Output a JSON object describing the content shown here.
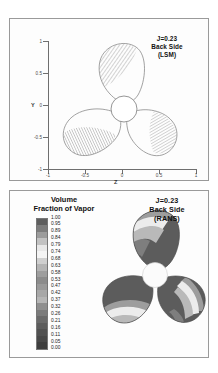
{
  "figure": {
    "panels": [
      {
        "id": "lsm",
        "annotation": [
          "J=0.23",
          "Back Side",
          "(LSM)"
        ],
        "xlabel": "Z",
        "ylabel": "Y",
        "xticks": [
          "-1",
          "-0.5",
          "0",
          "0.5",
          "1"
        ],
        "yticks": [
          "1",
          "0.5",
          "0",
          "-0.5",
          "-1"
        ]
      },
      {
        "id": "rans",
        "annotation": [
          "J=0.23",
          "Back Side",
          "(RANS)"
        ],
        "legend_title": [
          "Volume",
          "Fraction of Vapor"
        ]
      }
    ]
  },
  "chart_data": {
    "type": "heatmap",
    "subcharts": [
      {
        "name": "LSM",
        "annotation": "J=0.23 Back Side (LSM)",
        "xlabel": "Z",
        "ylabel": "Y",
        "xlim": [
          -1.25,
          1.25
        ],
        "ylim": [
          -1.15,
          1.15
        ],
        "xticks": [
          -1,
          -0.5,
          0,
          0.5,
          1
        ],
        "yticks": [
          -1,
          -0.5,
          0,
          0.5,
          1
        ],
        "grid": false,
        "render": "line-contour",
        "blades": 3,
        "blade_angles_deg": [
          90,
          210,
          330
        ],
        "hub_radius": 0.16
      },
      {
        "name": "RANS",
        "annotation": "J=0.23 Back Side (RANS)",
        "render": "filled-contour-grayscale",
        "blades": 3,
        "blade_angles_deg": [
          90,
          210,
          330
        ],
        "hub_radius": 0.17,
        "axes_visible": false
      }
    ],
    "colorbar": {
      "label": "Volume Fraction of Vapor",
      "orientation": "vertical",
      "vmin": 0.0,
      "vmax": 1.0,
      "levels": 20,
      "ticks": [
        "1.00",
        "0.95",
        "0.89",
        "0.84",
        "0.79",
        "0.74",
        "0.68",
        "0.63",
        "0.58",
        "0.53",
        "0.47",
        "0.42",
        "0.37",
        "0.32",
        "0.26",
        "0.21",
        "0.16",
        "0.11",
        "0.05",
        "0.00"
      ],
      "tick_values": [
        1.0,
        0.95,
        0.89,
        0.84,
        0.79,
        0.74,
        0.68,
        0.63,
        0.58,
        0.53,
        0.47,
        0.42,
        0.37,
        0.32,
        0.26,
        0.21,
        0.16,
        0.11,
        0.05,
        0.0
      ],
      "swatch_colors": [
        "#5e5e5e",
        "#7d7d7d",
        "#9c9c9c",
        "#c2c2c2",
        "#e8e8e8",
        "#f4f4f4",
        "#cfcfcf",
        "#b4b4b4",
        "#9e9e9e",
        "#8c8c8c",
        "#9a9a9a",
        "#a8a8a8",
        "#b6b6b6",
        "#8f8f8f",
        "#7b7b7b",
        "#6a6a6a",
        "#5c5c5c",
        "#515151",
        "#484848",
        "#3e3e3e"
      ]
    },
    "colors": {
      "blade_fill_dark": "#5a5a5a",
      "blade_band_light": "#e9e9e9",
      "blade_edge_mid": "#8d8d8d",
      "hub": "#fbfbfb",
      "axis": "#6f6f6f",
      "panel_border": "#9a9a9a",
      "background": "#ffffff"
    }
  }
}
